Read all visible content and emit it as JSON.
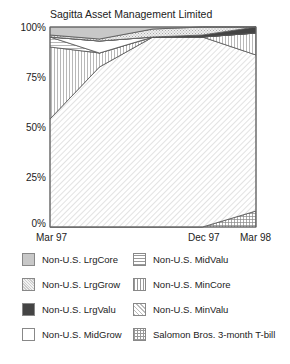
{
  "header_fragment": "",
  "chart_data": {
    "type": "area",
    "stacked": true,
    "normalized": true,
    "title": "Sagitta Asset Management Limited",
    "xlabel": "",
    "ylabel": "",
    "ylim": [
      0,
      100
    ],
    "y_ticks": [
      "0%",
      "25%",
      "50%",
      "75%",
      "100%"
    ],
    "x_tick_labels": [
      "Mar 97",
      "Dec 97",
      "Mar 98"
    ],
    "x": [
      "Mar 97",
      "Jun 97",
      "Sep 97",
      "Dec 97",
      "Mar 98"
    ],
    "series": [
      {
        "name": "Salomon Bros. 3-month T-bill",
        "pattern": "grid",
        "values": [
          0,
          0,
          0,
          0,
          8
        ]
      },
      {
        "name": "Non-U.S. MinValu",
        "pattern": "diagonal",
        "values": [
          54,
          80,
          95,
          95,
          78
        ]
      },
      {
        "name": "Non-U.S. MinCore",
        "pattern": "vertical",
        "values": [
          36,
          7,
          0,
          0,
          11
        ]
      },
      {
        "name": "Non-U.S. MidValu",
        "pattern": "horizontal",
        "values": [
          5,
          0,
          0,
          0,
          0
        ]
      },
      {
        "name": "Non-U.S. MidGrow",
        "pattern": "white",
        "values": [
          0,
          6,
          0,
          0,
          0
        ]
      },
      {
        "name": "Non-U.S. LrgValu",
        "pattern": "dark",
        "values": [
          0,
          0,
          0,
          1,
          3
        ]
      },
      {
        "name": "Non-U.S. LrgGrow",
        "pattern": "dots",
        "values": [
          1,
          1,
          4,
          4,
          0
        ]
      },
      {
        "name": "Non-U.S. LrgCore",
        "pattern": "lightgray",
        "values": [
          4,
          6,
          1,
          0,
          0
        ]
      }
    ],
    "grid": false,
    "legend_position": "bottom"
  },
  "legend": {
    "items": [
      {
        "label": "Non-U.S. LrgCore",
        "pattern": "lightgray"
      },
      {
        "label": "Non-U.S. LrgGrow",
        "pattern": "dots"
      },
      {
        "label": "Non-U.S. LrgValu",
        "pattern": "dark"
      },
      {
        "label": "Non-U.S. MidGrow",
        "pattern": "white"
      },
      {
        "label": "Non-U.S. MidValu",
        "pattern": "horizontal"
      },
      {
        "label": "Non-U.S. MinCore",
        "pattern": "vertical"
      },
      {
        "label": "Non-U.S. MinValu",
        "pattern": "diagonal"
      },
      {
        "label": "Salomon Bros. 3-month T-bill",
        "pattern": "grid"
      }
    ]
  },
  "colors": {
    "lightgray": "#c8c8c8",
    "dark": "#444444",
    "outline": "#555555"
  }
}
